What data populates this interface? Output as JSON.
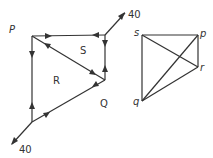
{
  "figure_left": {
    "nodes": {
      "P": "P",
      "Q": "Q"
    },
    "regions": {
      "R": "R",
      "S": "S"
    },
    "external_forces": [
      {
        "label": "40",
        "direction": "up-right",
        "at": "top-right corner"
      },
      {
        "label": "40",
        "direction": "down-left",
        "at": "bottom-left corner"
      }
    ]
  },
  "figure_right": {
    "nodes": {
      "s": "s",
      "p": "p",
      "r": "r",
      "q": "q"
    }
  }
}
